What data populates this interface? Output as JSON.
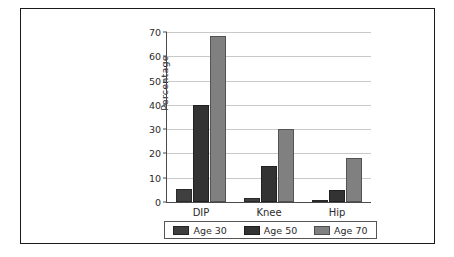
{
  "chart_data": {
    "type": "bar",
    "title": "",
    "xlabel": "",
    "ylabel": "Percentage",
    "categories": [
      "DIP",
      "Knee",
      "Hip"
    ],
    "series": [
      {
        "name": "Age 30",
        "color": "#3f3f3f",
        "values": [
          5.3,
          1.5,
          0.7
        ]
      },
      {
        "name": "Age 50",
        "color": "#333333",
        "values": [
          40,
          15,
          5
        ]
      },
      {
        "name": "Age 70",
        "color": "#808080",
        "values": [
          68.5,
          30,
          18
        ]
      }
    ],
    "ylim": [
      0,
      70
    ],
    "yticks": [
      0,
      10,
      20,
      30,
      40,
      50,
      60,
      70
    ],
    "ytick_labels": [
      "0",
      "10",
      "20",
      "30",
      "40",
      "50",
      "60",
      "70"
    ],
    "grid": true,
    "legend_position": "bottom",
    "legend_entries": [
      "Age 30",
      "Age 50",
      "Age 70"
    ]
  },
  "frame": {
    "border_color": "#1a1a1a",
    "background": "#ffffff"
  }
}
